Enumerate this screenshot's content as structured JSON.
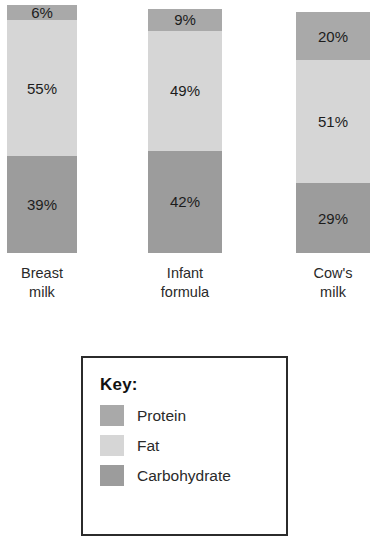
{
  "chart_data": {
    "type": "bar",
    "subtype": "stacked-bar-100",
    "title": "",
    "xlabel": "",
    "ylabel": "",
    "ylim": [
      0,
      100
    ],
    "grid": false,
    "legend_position": "bottom",
    "legend_title": "Key:",
    "categories": [
      "Breast milk",
      "Infant formula",
      "Cow's milk"
    ],
    "category_lines": [
      [
        "Breast",
        "milk"
      ],
      [
        "Infant",
        "formula"
      ],
      [
        "Cow's",
        "milk"
      ]
    ],
    "series": [
      {
        "name": "Protein",
        "color": "#a9a9a9",
        "values": [
          6,
          9,
          20
        ],
        "labels": [
          "6%",
          "9%",
          "20%"
        ]
      },
      {
        "name": "Fat",
        "color": "#d6d6d6",
        "values": [
          55,
          49,
          51
        ],
        "labels": [
          "55%",
          "49%",
          "51%"
        ]
      },
      {
        "name": "Carbohydrate",
        "color": "#9c9c9c",
        "values": [
          39,
          42,
          29
        ],
        "labels": [
          "39%",
          "42%",
          "29%"
        ]
      }
    ]
  },
  "bars": [
    {
      "category": "Breast milk",
      "line1": "Breast",
      "line2": "milk",
      "protein_label": "6%",
      "fat_label": "55%",
      "carb_label": "39%"
    },
    {
      "category": "Infant formula",
      "line1": "Infant",
      "line2": "formula",
      "protein_label": "9%",
      "fat_label": "49%",
      "carb_label": "42%"
    },
    {
      "category": "Cow's milk",
      "line1": "Cow's",
      "line2": "milk",
      "protein_label": "20%",
      "fat_label": "51%",
      "carb_label": "29%"
    }
  ],
  "key": {
    "title": "Key:",
    "items": [
      {
        "label": "Protein",
        "color": "#a9a9a9"
      },
      {
        "label": "Fat",
        "color": "#d6d6d6"
      },
      {
        "label": "Carbohydrate",
        "color": "#9c9c9c"
      }
    ]
  }
}
